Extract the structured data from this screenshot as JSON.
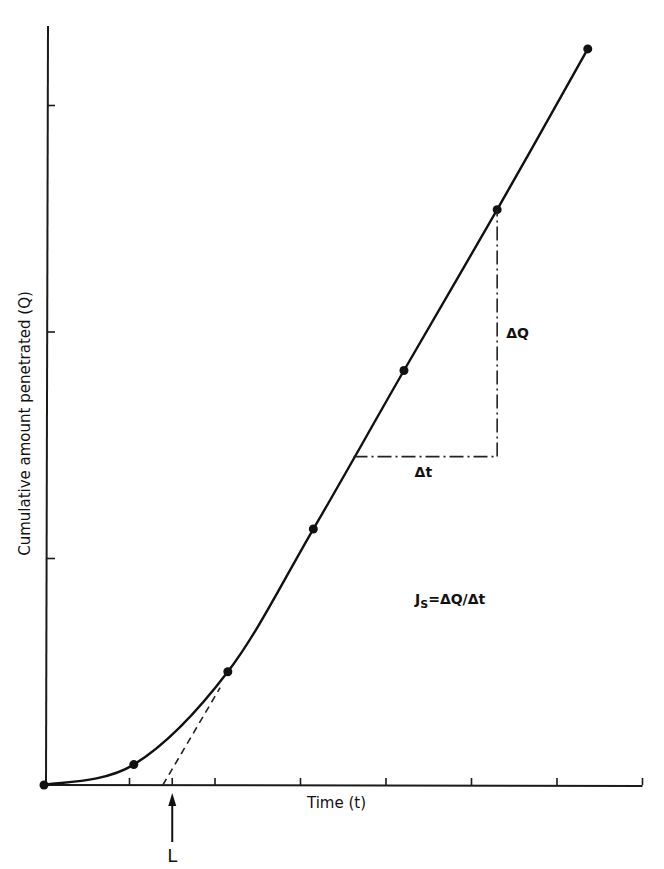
{
  "chart_data": {
    "type": "line",
    "title": "",
    "xlabel": "Time (t)",
    "ylabel": "Cumulative amount penetrated (Q)",
    "xlim": [
      0,
      7
    ],
    "ylim": [
      0,
      3.35
    ],
    "x_ticks": [
      1,
      1.5,
      2,
      3,
      4,
      5,
      6,
      7
    ],
    "y_ticks": [
      1,
      2,
      3
    ],
    "tick_labels_shown": false,
    "grid": false,
    "legend": "none",
    "series": [
      {
        "name": "Cumulative amount penetrated",
        "style": "solid curve with markers",
        "points": [
          {
            "x": 0.0,
            "y": 0.0
          },
          {
            "x": 1.05,
            "y": 0.09
          },
          {
            "x": 2.15,
            "y": 0.5
          },
          {
            "x": 3.15,
            "y": 1.13
          },
          {
            "x": 4.21,
            "y": 1.83
          },
          {
            "x": 5.3,
            "y": 2.54
          },
          {
            "x": 6.36,
            "y": 3.25
          }
        ]
      },
      {
        "name": "Steady-state extrapolation",
        "style": "dashed",
        "points": [
          {
            "x": 1.39,
            "y": 0.0
          },
          {
            "x": 2.06,
            "y": 0.43
          }
        ]
      }
    ],
    "annotations": {
      "lag_time": {
        "label": "L",
        "x": 1.5
      },
      "delta_t": {
        "label": "Δt",
        "from_x": 3.62,
        "to_x": 5.3,
        "y": 1.45
      },
      "delta_q": {
        "label": "ΔQ",
        "x": 5.3,
        "from_y": 1.45,
        "to_y": 2.54
      },
      "flux_equation": {
        "prefix": "J",
        "subscript": "S",
        "rest": "=ΔQ/Δt"
      }
    }
  }
}
